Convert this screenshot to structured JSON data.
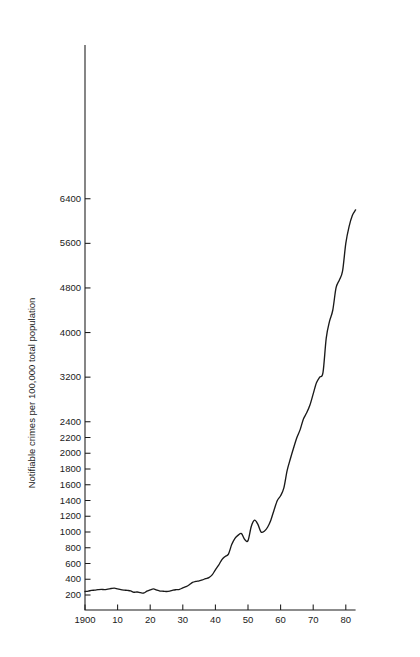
{
  "chart_data": {
    "type": "line",
    "title": "",
    "subtitle": "",
    "xlabel": "",
    "ylabel": "Notifiable crimes per 100,000 total population",
    "xlim": [
      1900,
      1983
    ],
    "ylim": [
      0,
      6400
    ],
    "grid": false,
    "legend": null,
    "axis_note": "Y axis uses a broken (split) scale: 200-unit steps up to 2400, then 800-unit steps from 2400 to 6400.",
    "x_tick_labels": [
      "1900",
      "10",
      "20",
      "30",
      "40",
      "50",
      "60",
      "70",
      "80"
    ],
    "x_tick_values": [
      1900,
      1910,
      1920,
      1930,
      1940,
      1950,
      1960,
      1970,
      1980
    ],
    "y_tick_labels": [
      "200",
      "400",
      "600",
      "800",
      "1000",
      "1200",
      "1400",
      "1600",
      "1800",
      "2000",
      "2200",
      "2400",
      "3200",
      "4000",
      "4800",
      "5600",
      "6400"
    ],
    "y_tick_values": [
      200,
      400,
      600,
      800,
      1000,
      1200,
      1400,
      1600,
      1800,
      2000,
      2200,
      2400,
      3200,
      4000,
      4800,
      5600,
      6400
    ],
    "series": [
      {
        "name": "Notifiable crimes per 100,000 total population",
        "color": "#1a1a1a",
        "x": [
          1900,
          1901,
          1902,
          1903,
          1904,
          1905,
          1906,
          1907,
          1908,
          1909,
          1910,
          1911,
          1912,
          1913,
          1914,
          1915,
          1916,
          1917,
          1918,
          1919,
          1920,
          1921,
          1922,
          1923,
          1924,
          1925,
          1926,
          1927,
          1928,
          1929,
          1930,
          1931,
          1932,
          1933,
          1934,
          1935,
          1936,
          1937,
          1938,
          1939,
          1940,
          1941,
          1942,
          1943,
          1944,
          1945,
          1946,
          1947,
          1948,
          1949,
          1950,
          1951,
          1952,
          1953,
          1954,
          1955,
          1956,
          1957,
          1958,
          1959,
          1960,
          1961,
          1962,
          1963,
          1964,
          1965,
          1966,
          1967,
          1968,
          1969,
          1970,
          1971,
          1972,
          1973,
          1974,
          1975,
          1976,
          1977,
          1978,
          1979,
          1980,
          1981,
          1982,
          1983
        ],
        "values": [
          245,
          250,
          258,
          262,
          268,
          272,
          268,
          275,
          282,
          288,
          278,
          268,
          262,
          258,
          252,
          235,
          238,
          230,
          225,
          248,
          265,
          278,
          262,
          250,
          248,
          245,
          250,
          262,
          268,
          272,
          290,
          305,
          330,
          360,
          372,
          380,
          392,
          408,
          420,
          455,
          520,
          580,
          650,
          690,
          720,
          840,
          920,
          960,
          980,
          905,
          890,
          1070,
          1150,
          1100,
          1000,
          1010,
          1060,
          1150,
          1280,
          1400,
          1460,
          1560,
          1780,
          1930,
          2070,
          2200,
          2300,
          2450,
          2560,
          2700,
          2900,
          3100,
          3200,
          3280,
          3900,
          4200,
          4400,
          4800,
          4940,
          5100,
          5600,
          5900,
          6100,
          6200
        ]
      }
    ]
  },
  "axis": {
    "y_title": "Notifiable crimes per 100,000 total population"
  }
}
